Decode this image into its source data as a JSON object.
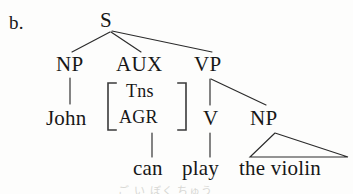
{
  "figure": {
    "item_label": "b.",
    "caption": ""
  },
  "tree": {
    "root": {
      "id": "S",
      "label": "S",
      "x": 108,
      "y": 20
    },
    "nodes": [
      {
        "id": "NP1",
        "label": "NP",
        "x": 70,
        "y": 64,
        "level": 1
      },
      {
        "id": "AUX",
        "label": "AUX",
        "x": 140,
        "y": 64,
        "level": 1
      },
      {
        "id": "VP",
        "label": "VP",
        "x": 212,
        "y": 64,
        "level": 1
      },
      {
        "id": "John",
        "label": "John",
        "x": 74,
        "y": 118,
        "level": 2
      },
      {
        "id": "V",
        "label": "V",
        "x": 210,
        "y": 118,
        "level": 2
      },
      {
        "id": "NP2",
        "label": "NP",
        "x": 266,
        "y": 118,
        "level": 2
      }
    ],
    "aux_features": {
      "bracket_label": "feature-matrix",
      "rows": [
        {
          "label": "Tns"
        },
        {
          "label": "AGR"
        }
      ]
    },
    "terminals": [
      {
        "id": "t-john",
        "label": "John",
        "parent": "NP1"
      },
      {
        "id": "t-can",
        "label": "can",
        "parent": "AUX"
      },
      {
        "id": "t-play",
        "label": "play",
        "parent": "V"
      },
      {
        "id": "t-theviolin",
        "label": "the violin",
        "parent": "NP2"
      }
    ],
    "edges": [
      {
        "from": "S",
        "to": "NP1",
        "type": "line"
      },
      {
        "from": "S",
        "to": "AUX",
        "type": "line"
      },
      {
        "from": "S",
        "to": "VP",
        "type": "line"
      },
      {
        "from": "NP1",
        "to": "John",
        "type": "line"
      },
      {
        "from": "VP",
        "to": "V",
        "type": "line"
      },
      {
        "from": "VP",
        "to": "NP2",
        "type": "line"
      },
      {
        "from": "AUX",
        "to": "can",
        "type": "line"
      },
      {
        "from": "V",
        "to": "play",
        "type": "line"
      },
      {
        "from": "NP2",
        "to": "the violin",
        "type": "triangle"
      }
    ],
    "triangle": {
      "apex_x": 275,
      "apex_y": 133,
      "base_left_x": 250,
      "base_right_x": 348,
      "base_y": 157
    }
  },
  "style": {
    "ink": "#171717",
    "line": "#2b2b2b",
    "paper": "#fdfdfc",
    "bleed": "#d8d8d4"
  },
  "bleed_through": "ご い ぼく ちゅう"
}
